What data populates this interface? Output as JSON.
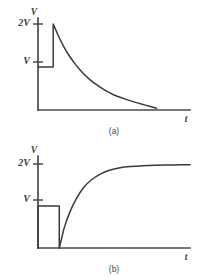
{
  "figure": {
    "panels": [
      {
        "id": "a",
        "caption": "(a)",
        "y_axis_label": "V",
        "x_axis_label": "t",
        "ticks": [
          {
            "label": "2V",
            "value": 2
          },
          {
            "label": "V",
            "value": 1
          }
        ]
      },
      {
        "id": "b",
        "caption": "(b)",
        "y_axis_label": "V",
        "x_axis_label": "t",
        "ticks": [
          {
            "label": "2V",
            "value": 2
          },
          {
            "label": "V",
            "value": 1
          }
        ]
      }
    ]
  },
  "chart_data": [
    {
      "type": "line",
      "panel": "a",
      "title": "(a)",
      "xlabel": "t",
      "ylabel": "V",
      "xlim": [
        0,
        10
      ],
      "ylim": [
        0,
        2.35
      ],
      "grid": false,
      "legend": false,
      "ytick_values": [
        1,
        2
      ],
      "ytick_labels": [
        "V",
        "2V"
      ],
      "description": "Voltage held at V, then a jump to 2V at t=1 followed by an exponential decay toward 0.",
      "series": [
        {
          "name": "voltage",
          "x": [
            0.0,
            1.0,
            1.0,
            1.15,
            1.4,
            1.7,
            2.0,
            2.4,
            2.8,
            3.3,
            3.8,
            4.4,
            5.0,
            5.6,
            6.2,
            6.8,
            7.4,
            7.8
          ],
          "y": [
            1.0,
            1.0,
            2.0,
            1.88,
            1.68,
            1.47,
            1.29,
            1.09,
            0.92,
            0.74,
            0.6,
            0.46,
            0.35,
            0.27,
            0.2,
            0.14,
            0.08,
            0.04
          ]
        }
      ]
    },
    {
      "type": "line",
      "panel": "b",
      "title": "(b)",
      "xlabel": "t",
      "ylabel": "V",
      "xlim": [
        0,
        10
      ],
      "ylim": [
        0,
        2.35
      ],
      "grid": false,
      "legend": false,
      "ytick_values": [
        1,
        2
      ],
      "ytick_labels": [
        "V",
        "2V"
      ],
      "description": "Rectangular pulse of height V from t=0 to t=1.4 dropping to 0, followed by an exponential rise asymptotic to 2V.",
      "series": [
        {
          "name": "pulse",
          "x": [
            0.0,
            0.0,
            1.4,
            1.4
          ],
          "y": [
            0.0,
            1.0,
            1.0,
            0.0
          ]
        },
        {
          "name": "voltage",
          "x": [
            1.4,
            1.7,
            2.1,
            2.5,
            3.0,
            3.5,
            4.1,
            4.7,
            5.4,
            6.1,
            6.9,
            7.7,
            8.6,
            9.5,
            10.0
          ],
          "y": [
            0.0,
            0.45,
            0.86,
            1.16,
            1.44,
            1.62,
            1.76,
            1.85,
            1.91,
            1.94,
            1.96,
            1.97,
            1.975,
            1.98,
            1.98
          ]
        }
      ]
    }
  ],
  "colors": {
    "trace": "#3a3a3a",
    "axis": "#4a4a4a",
    "label": "#3d3d3d",
    "background": "#ffffff"
  }
}
